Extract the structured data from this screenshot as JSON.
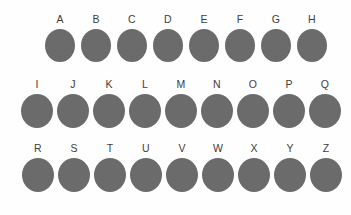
{
  "canvas": {
    "background_color": "#fefefe",
    "width": 351,
    "height": 215
  },
  "style": {
    "dot_color": "#6b6b6b",
    "label_color": "#3d3d3d"
  },
  "rows": [
    {
      "id": "row-1",
      "items": [
        {
          "label": "A"
        },
        {
          "label": "B"
        },
        {
          "label": "C"
        },
        {
          "label": "D"
        },
        {
          "label": "E"
        },
        {
          "label": "F"
        },
        {
          "label": "G"
        },
        {
          "label": "H"
        }
      ]
    },
    {
      "id": "row-2",
      "items": [
        {
          "label": "I"
        },
        {
          "label": "J"
        },
        {
          "label": "K"
        },
        {
          "label": "L"
        },
        {
          "label": "M"
        },
        {
          "label": "N"
        },
        {
          "label": "O"
        },
        {
          "label": "P"
        },
        {
          "label": "Q"
        }
      ]
    },
    {
      "id": "row-3",
      "items": [
        {
          "label": "R"
        },
        {
          "label": "S"
        },
        {
          "label": "T"
        },
        {
          "label": "U"
        },
        {
          "label": "V"
        },
        {
          "label": "W"
        },
        {
          "label": "X"
        },
        {
          "label": "Y"
        },
        {
          "label": "Z"
        }
      ]
    }
  ]
}
